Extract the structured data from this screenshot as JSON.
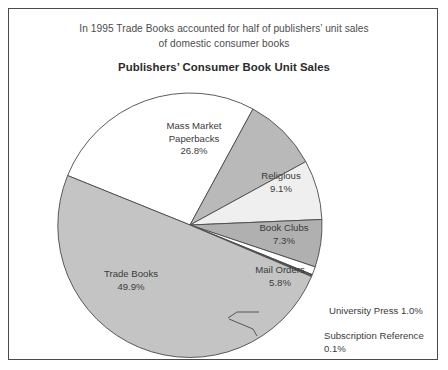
{
  "figure": {
    "caption_line1": "In 1995 Trade Books accounted for half of publishers’ unit sales",
    "caption_line2": "of domestic consumer books",
    "title": "Publishers’ Consumer Book Unit Sales"
  },
  "chart_data": {
    "type": "pie",
    "title": "Publishers’ Consumer Book Unit Sales",
    "subtitle": "In 1995 Trade Books accounted for half of publishers’ unit sales of domestic consumer books",
    "xlabel": "",
    "ylabel": "",
    "legend": "none",
    "grid": false,
    "units": "percent of unit sales",
    "categories": [
      "Mass Market Paperbacks",
      "Religious",
      "Book Clubs",
      "Mail Orders",
      "University Press",
      "Subscription Reference",
      "Trade Books"
    ],
    "values": [
      26.8,
      9.1,
      7.3,
      5.8,
      1.0,
      0.1,
      49.9
    ],
    "slices": [
      {
        "name": "Mass Market Paperbacks",
        "label": "Mass Market",
        "label2": "Paperbacks",
        "value": 26.8,
        "value_text": "26.8%",
        "color": "#ffffff",
        "start_angle": -68.0,
        "sweep": 96.5,
        "label_placement": "inside",
        "label_x": 185,
        "label_y": 120
      },
      {
        "name": "Religious",
        "label": "Religious",
        "value": 9.1,
        "value_text": "9.1%",
        "color": "#b9b9b9",
        "start_angle": 28.5,
        "sweep": 32.8,
        "label_placement": "inside",
        "label_x": 272,
        "label_y": 170
      },
      {
        "name": "Book Clubs",
        "label": "Book Clubs",
        "value": 7.3,
        "value_text": "7.3%",
        "color": "#efefef",
        "start_angle": 61.3,
        "sweep": 26.3,
        "label_placement": "inside",
        "label_x": 275,
        "label_y": 222
      },
      {
        "name": "Mail Orders",
        "label": "Mail Orders",
        "value": 5.8,
        "value_text": "5.8%",
        "color": "#b0b0b0",
        "start_angle": 87.6,
        "sweep": 20.9,
        "label_placement": "inside",
        "label_x": 271,
        "label_y": 264
      },
      {
        "name": "University Press",
        "label": "University Press 1.0%",
        "value": 1.0,
        "value_text": "1.0%",
        "color": "#ffffff",
        "start_angle": 108.5,
        "sweep": 3.6,
        "label_placement": "callout",
        "label_x": 320,
        "label_y": 305
      },
      {
        "name": "Subscription Reference",
        "label": "Subscription Reference",
        "label2": "0.1%",
        "value": 0.1,
        "value_text": "0.1%",
        "color": "#555555",
        "start_angle": 112.1,
        "sweep": 0.9,
        "label_placement": "callout",
        "label_x": 315,
        "label_y": 330
      },
      {
        "name": "Trade Books",
        "label": "Trade Books",
        "value": 49.9,
        "value_text": "49.9%",
        "color": "#c4c4c4",
        "start_angle": 113.0,
        "sweep": 179.0,
        "label_placement": "inside",
        "label_x": 122,
        "label_y": 268
      }
    ],
    "geometry": {
      "center_x": 181,
      "center_y": 216,
      "radius": 132
    },
    "callouts": [
      {
        "name": "University Press",
        "text": "University Press 1.0%",
        "line": "M 228,303 L 250,303",
        "tip": "M 228,303 L 219,309"
      },
      {
        "name": "Subscription Reference",
        "text": "Subscription Reference",
        "text2": "0.1%",
        "line": "M 248,327 L 244,320",
        "tip": "M 244,320 L 220,310"
      }
    ]
  }
}
